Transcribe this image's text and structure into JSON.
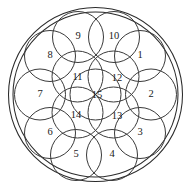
{
  "figure": {
    "name": "circle-packing-15",
    "canvas": {
      "width": 191,
      "height": 189
    },
    "background_color": "#ffffff",
    "stroke_color": "#3a3a3a",
    "boundary_stroke_color": "#2b2b2b"
  },
  "boundary": {
    "outer": {
      "cx": 95.5,
      "cy": 94.5,
      "r": 87.0
    },
    "inner": {
      "cx": 95.5,
      "cy": 94.5,
      "r": 82.5
    }
  },
  "packing": {
    "radius": 25.5,
    "center_ring": {
      "label": "15",
      "cx": 95.5,
      "cy": 94.5
    },
    "inner_ring": {
      "count": 4,
      "ring_radius": 25.5,
      "circles": [
        {
          "label": "11",
          "cx": 77.5,
          "cy": 76.5
        },
        {
          "label": "12",
          "cx": 113.5,
          "cy": 76.5
        },
        {
          "label": "13",
          "cx": 113.5,
          "cy": 112.5
        },
        {
          "label": "14",
          "cx": 77.5,
          "cy": 112.5
        }
      ]
    },
    "outer_ring": {
      "count": 10,
      "ring_radius": 56.5,
      "circles": [
        {
          "label": "1",
          "cx": 140.0,
          "cy": 56.0
        },
        {
          "label": "2",
          "cx": 151.0,
          "cy": 94.5
        },
        {
          "label": "3",
          "cx": 140.0,
          "cy": 133.0
        },
        {
          "label": "4",
          "cx": 112.0,
          "cy": 155.0
        },
        {
          "label": "5",
          "cx": 76.0,
          "cy": 155.0
        },
        {
          "label": "6",
          "cx": 50.0,
          "cy": 133.0
        },
        {
          "label": "7",
          "cx": 40.0,
          "cy": 94.5
        },
        {
          "label": "8",
          "cx": 50.0,
          "cy": 56.0
        },
        {
          "label": "9",
          "cx": 78.0,
          "cy": 37.0
        },
        {
          "label": "10",
          "cx": 114.0,
          "cy": 37.0
        }
      ]
    }
  },
  "labels": {
    "c1": "1",
    "c2": "2",
    "c3": "3",
    "c4": "4",
    "c5": "5",
    "c6": "6",
    "c7": "7",
    "c8": "8",
    "c9": "9",
    "c10": "10",
    "c11": "11",
    "c12": "12",
    "c13": "13",
    "c14": "14",
    "c15": "15"
  },
  "label_offsets": {
    "c11": {
      "x": 77.5,
      "y": 78.0
    },
    "c12": {
      "x": 117.0,
      "y": 79.0
    },
    "c13": {
      "x": 117.0,
      "y": 117.0
    },
    "c14": {
      "x": 76.0,
      "y": 116.0
    },
    "c15": {
      "x": 97.0,
      "y": 96.0
    }
  }
}
